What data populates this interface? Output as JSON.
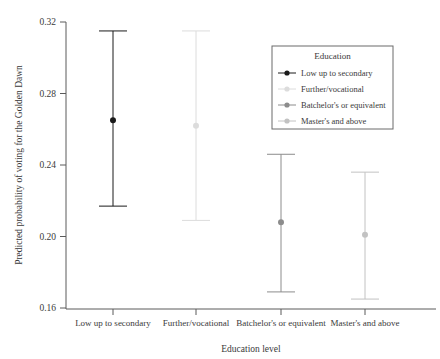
{
  "chart_data": {
    "type": "scatter",
    "title": "",
    "xlabel": "Education level",
    "ylabel": "Predicted probability of voting for the Golden Dawn",
    "ylim": [
      0.16,
      0.32
    ],
    "yticks": [
      "0.16",
      "0.20",
      "0.24",
      "0.28",
      "0.32"
    ],
    "ytick_values": [
      0.16,
      0.2,
      0.24,
      0.28,
      0.32
    ],
    "grid": false,
    "legend_position": "top-right",
    "legend_title": "Education",
    "categories": [
      "Low up to secondary",
      "Further/vocational",
      "Batchelor's or equivalent",
      "Master's and above"
    ],
    "values": [
      0.265,
      0.262,
      0.208,
      0.201
    ],
    "ci_lower": [
      0.217,
      0.209,
      0.169,
      0.165
    ],
    "ci_upper": [
      0.315,
      0.315,
      0.246,
      0.236
    ],
    "series": [
      {
        "name": "Low up to secondary",
        "value": 0.265,
        "ci_lower": 0.217,
        "ci_upper": 0.315,
        "color": "#1a1a1a"
      },
      {
        "name": "Further/vocational",
        "value": 0.262,
        "ci_lower": 0.209,
        "ci_upper": 0.315,
        "color": "#dcdcdc"
      },
      {
        "name": "Batchelor's or equivalent",
        "value": 0.208,
        "ci_lower": 0.169,
        "ci_upper": 0.246,
        "color": "#8c8c8c"
      },
      {
        "name": "Master's and above",
        "value": 0.201,
        "ci_lower": 0.165,
        "ci_upper": 0.236,
        "color": "#c2c2c2"
      }
    ]
  }
}
